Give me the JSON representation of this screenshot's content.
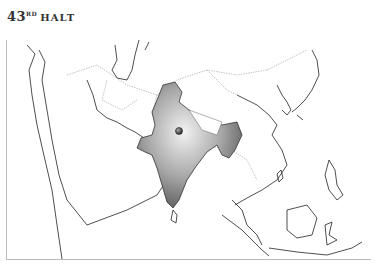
{
  "header": {
    "number": "43",
    "ordinal": "RD",
    "word": "HALT"
  },
  "map": {
    "region": "Asia",
    "highlighted_country": "India",
    "highlight_color": "#8a8a8a",
    "marker": {
      "label": "location-marker",
      "color": "#444444"
    },
    "border_color": "#222222",
    "internal_border_color": "#888888"
  }
}
